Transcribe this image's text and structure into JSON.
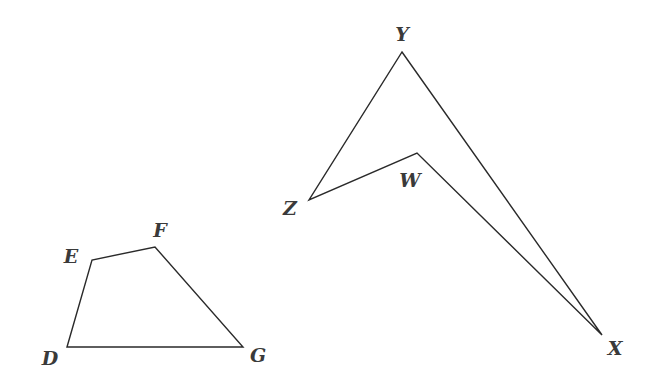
{
  "diagram": {
    "stroke_color": "#2a2a2a",
    "label_color": "#3a3a3a",
    "shapes": [
      {
        "name": "quadrilateral-DEFG",
        "vertices": [
          "D",
          "E",
          "F",
          "G"
        ],
        "points": "67,347 92,260 155,247 243,347"
      },
      {
        "name": "quadrilateral-WXYZ",
        "vertices": [
          "Y",
          "X",
          "W",
          "Z"
        ],
        "points": "402,52 602,335 417,153 309,200"
      }
    ],
    "labels": {
      "D": "D",
      "E": "E",
      "F": "F",
      "G": "G",
      "W": "W",
      "X": "X",
      "Y": "Y",
      "Z": "Z"
    }
  }
}
